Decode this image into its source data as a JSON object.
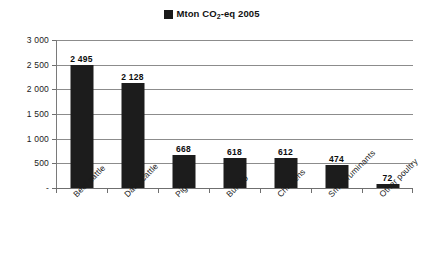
{
  "chart_data": {
    "type": "bar",
    "title": "",
    "legend": {
      "position": "top-center",
      "entries": [
        {
          "label_prefix": "Mton CO",
          "label_sub": "2",
          "label_suffix": "-eq 2005",
          "color": "#1a1a1a"
        }
      ]
    },
    "categories": [
      "Beef cattle",
      "Dairy cattle",
      "Pigs",
      "Buffalo",
      "Chickens",
      "Small ruminants",
      "Other poultry"
    ],
    "values": [
      2495,
      2128,
      668,
      618,
      612,
      474,
      72
    ],
    "value_labels": [
      "2 495",
      "2 128",
      "668",
      "618",
      "612",
      "474",
      "72"
    ],
    "xlabel": "",
    "ylabel": "",
    "ylim": [
      0,
      3000
    ],
    "yticks": [
      0,
      500,
      1000,
      1500,
      2000,
      2500,
      3000
    ],
    "ytick_labels": [
      "-",
      "500",
      "1 000",
      "1 500",
      "2 000",
      "2 500",
      "3 000"
    ],
    "grid": true,
    "grid_color": "#8c8c8c",
    "bar_color": "#1c1c1c",
    "background": "#ffffff"
  }
}
